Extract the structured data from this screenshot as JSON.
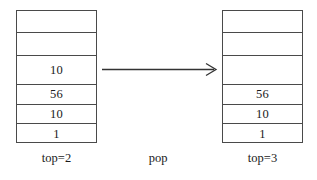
{
  "diagram": {
    "background_color": "#ffffff",
    "line_color": "#4a4a4a",
    "text_color": "#1a1a1a"
  },
  "left_stack": {
    "label": "top=2",
    "cells": [
      "",
      "",
      "10",
      "56",
      "10",
      "1"
    ]
  },
  "right_stack": {
    "label": "top=3",
    "cells": [
      "",
      "",
      "",
      "56",
      "10",
      "1"
    ]
  },
  "operation": {
    "label": "pop",
    "arrow": "arrow-right-icon"
  }
}
